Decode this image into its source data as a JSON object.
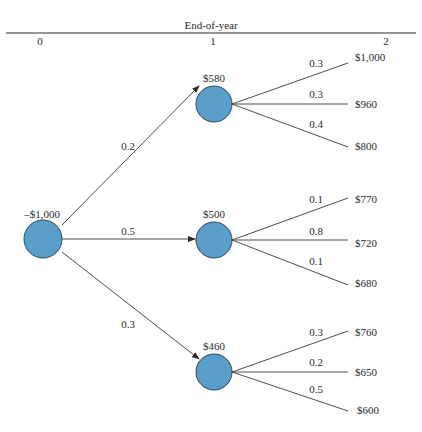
{
  "header": {
    "title": "End-of-year",
    "periods": [
      "0",
      "1",
      "2"
    ]
  },
  "root": {
    "value": "–$1,000"
  },
  "branches": [
    {
      "prob": "0.2",
      "value": "$580",
      "outcomes": [
        {
          "prob": "0.3",
          "value": "$1,000"
        },
        {
          "prob": "0.3",
          "value": "$960"
        },
        {
          "prob": "0.4",
          "value": "$800"
        }
      ]
    },
    {
      "prob": "0.5",
      "value": "$500",
      "outcomes": [
        {
          "prob": "0.1",
          "value": "$770"
        },
        {
          "prob": "0.8",
          "value": "$720"
        },
        {
          "prob": "0.1",
          "value": "$680"
        }
      ]
    },
    {
      "prob": "0.3",
      "value": "$460",
      "outcomes": [
        {
          "prob": "0.3",
          "value": "$760"
        },
        {
          "prob": "0.2",
          "value": "$650"
        },
        {
          "prob": "0.5",
          "value": "$600"
        }
      ]
    }
  ],
  "colors": {
    "node_fill": "#5a9dc8",
    "node_stroke": "#2a4a60",
    "line": "#3a3a3a"
  }
}
